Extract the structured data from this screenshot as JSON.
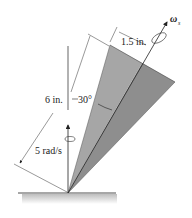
{
  "figure": {
    "labels": {
      "slant_length": "6 in.",
      "base_radius": "1.5 in.",
      "half_angle": "30°",
      "omega_vertical": "5 rad/s",
      "omega_spin": "ω",
      "omega_spin_sub": "s"
    },
    "colors": {
      "cone_light": "#a9a9a9",
      "cone_dark": "#8c8c8c",
      "line": "#222222",
      "ground_shadow": "#c8c8c8"
    }
  }
}
